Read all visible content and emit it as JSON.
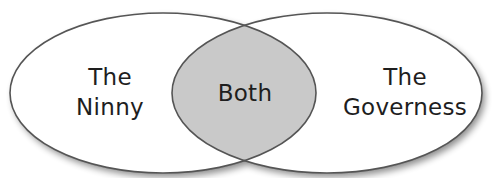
{
  "diagram": {
    "type": "venn",
    "sets": [
      {
        "id": "left",
        "label_line1": "The",
        "label_line2": "Ninny"
      },
      {
        "id": "right",
        "label_line1": "The",
        "label_line2": "Governess"
      }
    ],
    "intersection": {
      "label": "Both"
    },
    "colors": {
      "set_fill": "#ffffff",
      "intersection_fill": "#c9c9c9",
      "stroke": "#555555",
      "shadow": "#b5b5b5"
    }
  }
}
